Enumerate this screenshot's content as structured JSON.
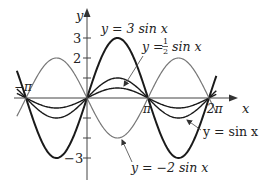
{
  "chart_data": {
    "type": "line",
    "title": "",
    "xlabel": "x",
    "ylabel": "y",
    "xlim": [
      -3.14159,
      6.28318
    ],
    "ylim": [
      -3,
      3
    ],
    "x_tick_labels": [
      "−π",
      "π",
      "2π"
    ],
    "x_ticks": [
      -3.14159,
      3.14159,
      6.28318
    ],
    "y_tick_labels": [
      "3",
      "2",
      "−3"
    ],
    "y_ticks": [
      3,
      2,
      1,
      -1,
      -2,
      -3
    ],
    "grid": false,
    "legend": "annotations with leader arrows",
    "series": [
      {
        "name": "y = 3 sin x",
        "amplitude": 3,
        "function": "3*sin(x)",
        "color": "#1a1a1a",
        "stroke_width": 2.0
      },
      {
        "name": "y = 1/2 sin x",
        "amplitude": 0.5,
        "function": "0.5*sin(x)",
        "color": "#1a1a1a",
        "stroke_width": 1.4
      },
      {
        "name": "y = sin x",
        "amplitude": 1,
        "function": "sin(x)",
        "color": "#1a1a1a",
        "stroke_width": 1.4
      },
      {
        "name": "y = -2 sin x",
        "amplitude": -2,
        "function": "-2*sin(x)",
        "color": "#777777",
        "stroke_width": 1.2
      }
    ],
    "annotations": [
      {
        "text": "y = 3 sin x",
        "points_to": "peak of 3 sin x near x = π/2"
      },
      {
        "text": "y = ½ sin x",
        "points_to": "½ sin x curve near x = π/2"
      },
      {
        "text": "y = sin x",
        "points_to": "sin x curve near x = 3π/2"
      },
      {
        "text": "y = −2 sin x",
        "points_to": "−2 sin x curve near x = π/2 (below axis)"
      }
    ]
  },
  "labels": {
    "y_axis": "y",
    "x_axis": "x",
    "tick_3": "3",
    "tick_2": "2",
    "tick_neg3": "−3",
    "tick_negpi": "−π",
    "tick_pi": "π",
    "tick_2pi": "2π",
    "ann_3sin": "y = 3 sin x",
    "ann_half_prefix": "y =",
    "ann_half_num": "1",
    "ann_half_den": "2",
    "ann_half_suffix": "sin x",
    "ann_sin": "y = sin x",
    "ann_neg2sin": "y = −2 sin x"
  }
}
